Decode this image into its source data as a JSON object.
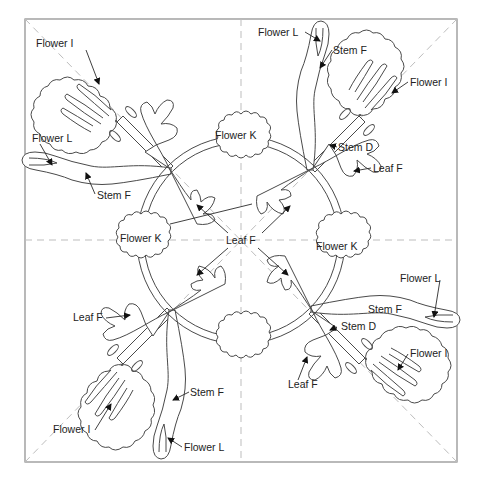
{
  "diagram": {
    "title": "",
    "canvas": {
      "width": 482,
      "height": 493
    },
    "frame": {
      "x": 25,
      "y": 19,
      "width": 432,
      "height": 443
    },
    "center": {
      "x": 241,
      "y": 240
    },
    "ring_radius": 100,
    "colors": {
      "outline": "#4a4a4a",
      "frame": "#8a8a8a",
      "guide": "#bdbdbd",
      "text": "#222222"
    },
    "labels": [
      {
        "id": "flower-i-tl",
        "text": "Flower I",
        "x": 36,
        "y": 47
      },
      {
        "id": "flower-l-tl",
        "text": "Flower L",
        "x": 32,
        "y": 142
      },
      {
        "id": "stem-f-tl",
        "text": "Stem F",
        "x": 97,
        "y": 199
      },
      {
        "id": "flower-l-tr",
        "text": "Flower L",
        "x": 258,
        "y": 36
      },
      {
        "id": "stem-f-tr",
        "text": "Stem F",
        "x": 333,
        "y": 54
      },
      {
        "id": "flower-i-tr",
        "text": "Flower I",
        "x": 410,
        "y": 86
      },
      {
        "id": "flower-k-top",
        "text": "Flower K",
        "x": 215,
        "y": 139
      },
      {
        "id": "stem-d-tr",
        "text": "Stem D",
        "x": 338,
        "y": 151
      },
      {
        "id": "leaf-f-tr",
        "text": "Leaf F",
        "x": 373,
        "y": 172
      },
      {
        "id": "flower-k-left",
        "text": "Flower K",
        "x": 120,
        "y": 242
      },
      {
        "id": "leaf-f-center",
        "text": "Leaf F",
        "x": 226,
        "y": 244
      },
      {
        "id": "flower-k-right",
        "text": "Flower K",
        "x": 316,
        "y": 250
      },
      {
        "id": "flower-l-br",
        "text": "Flower L",
        "x": 400,
        "y": 282
      },
      {
        "id": "stem-f-br",
        "text": "Stem F",
        "x": 368,
        "y": 313
      },
      {
        "id": "leaf-f-bl",
        "text": "Leaf F",
        "x": 73,
        "y": 321
      },
      {
        "id": "stem-d-br",
        "text": "Stem D",
        "x": 341,
        "y": 330
      },
      {
        "id": "flower-i-br",
        "text": "Flower I",
        "x": 410,
        "y": 357
      },
      {
        "id": "leaf-f-br",
        "text": "Leaf F",
        "x": 288,
        "y": 388
      },
      {
        "id": "stem-f-bl",
        "text": "Stem F",
        "x": 190,
        "y": 396
      },
      {
        "id": "flower-i-bl",
        "text": "Flower I",
        "x": 53,
        "y": 433
      },
      {
        "id": "flower-l-bl",
        "text": "Flower L",
        "x": 184,
        "y": 451
      }
    ],
    "parts": [
      "Flower I",
      "Flower K",
      "Flower L",
      "Stem D",
      "Stem F",
      "Leaf F"
    ]
  }
}
